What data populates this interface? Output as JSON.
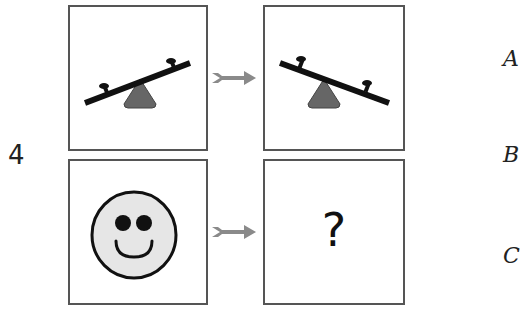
{
  "question": {
    "number": "4",
    "answer_placeholder": "?",
    "options_partial": [
      "A",
      "B",
      "C"
    ]
  },
  "colors": {
    "border": "#555555",
    "arrow": "#8a8a8a",
    "seesaw_beam": "#111111",
    "seesaw_base": "#666666",
    "face_fill": "#e6e6e6",
    "face_stroke": "#111111"
  },
  "panels": [
    {
      "id": "top-left",
      "content": "seesaw tilted up to the right"
    },
    {
      "id": "top-right",
      "content": "seesaw tilted down to the right"
    },
    {
      "id": "bottom-left",
      "content": "smiley face"
    },
    {
      "id": "bottom-right",
      "content": "question mark"
    }
  ]
}
